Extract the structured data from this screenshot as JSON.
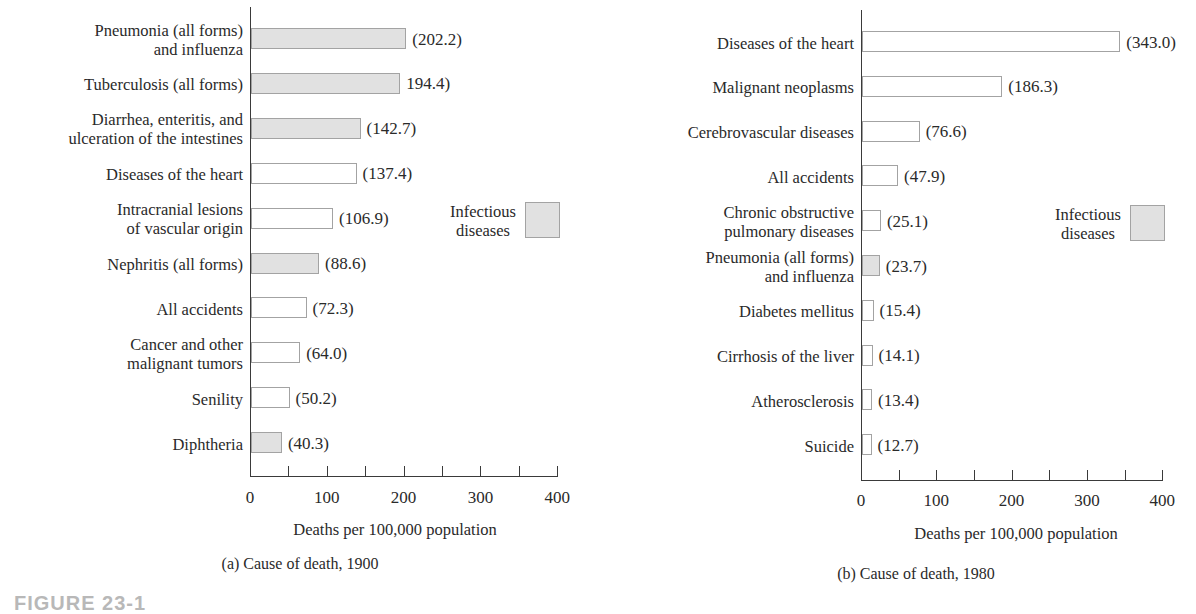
{
  "figure": {
    "label": "FIGURE 23-1"
  },
  "colors": {
    "infectious_fill": "#e1e1e1",
    "other_fill": "#ffffff",
    "bar_border": "#a3a3a3",
    "axis": "#3a3a3a",
    "text": "#2a2a2a"
  },
  "charts": [
    {
      "caption": "(a) Cause of death, 1900",
      "x_title": "Deaths per 100,000 population",
      "x_ticks": [
        "0",
        "100",
        "200",
        "300",
        "400"
      ],
      "legend": {
        "label": "Infectious\ndiseases"
      },
      "bars": [
        {
          "label": "Pneumonia (all forms)\nand influenza",
          "value_label": "(202.2)",
          "infectious": true
        },
        {
          "label": "Tuberculosis (all forms)",
          "value_label": "194.4)",
          "infectious": true
        },
        {
          "label": "Diarrhea, enteritis, and\nulceration of the intestines",
          "value_label": "(142.7)",
          "infectious": true
        },
        {
          "label": "Diseases of the heart",
          "value_label": "(137.4)",
          "infectious": false
        },
        {
          "label": "Intracranial lesions\nof vascular origin",
          "value_label": "(106.9)",
          "infectious": false
        },
        {
          "label": "Nephritis (all forms)",
          "value_label": "(88.6)",
          "infectious": true
        },
        {
          "label": "All accidents",
          "value_label": "(72.3)",
          "infectious": false
        },
        {
          "label": "Cancer and other\nmalignant tumors",
          "value_label": "(64.0)",
          "infectious": false
        },
        {
          "label": "Senility",
          "value_label": "(50.2)",
          "infectious": false
        },
        {
          "label": "Diphtheria",
          "value_label": "(40.3)",
          "infectious": true
        }
      ]
    },
    {
      "caption": "(b) Cause of death, 1980",
      "x_title": "Deaths per 100,000 population",
      "x_ticks": [
        "0",
        "100",
        "200",
        "300",
        "400"
      ],
      "legend": {
        "label": "Infectious\ndiseases"
      },
      "bars": [
        {
          "label": "Diseases of the heart",
          "value_label": "(343.0)",
          "infectious": false
        },
        {
          "label": "Malignant neoplasms",
          "value_label": "(186.3)",
          "infectious": false
        },
        {
          "label": "Cerebrovascular diseases",
          "value_label": "(76.6)",
          "infectious": false
        },
        {
          "label": "All accidents",
          "value_label": "(47.9)",
          "infectious": false
        },
        {
          "label": "Chronic obstructive\npulmonary diseases",
          "value_label": "(25.1)",
          "infectious": false
        },
        {
          "label": "Pneumonia (all forms)\nand influenza",
          "value_label": "(23.7)",
          "infectious": true
        },
        {
          "label": "Diabetes mellitus",
          "value_label": "(15.4)",
          "infectious": false
        },
        {
          "label": "Cirrhosis of the liver",
          "value_label": "(14.1)",
          "infectious": false
        },
        {
          "label": "Atherosclerosis",
          "value_label": "(13.4)",
          "infectious": false
        },
        {
          "label": "Suicide",
          "value_label": "(12.7)",
          "infectious": false
        }
      ]
    }
  ],
  "chart_data": [
    {
      "type": "bar",
      "orientation": "horizontal",
      "title": "(a) Cause of death, 1900",
      "xlabel": "Deaths per 100,000 population",
      "ylabel": "",
      "xlim": [
        0,
        400
      ],
      "x_ticks": [
        0,
        100,
        200,
        300,
        400
      ],
      "x_minor_ticks": [
        50,
        150,
        250,
        350
      ],
      "grid": false,
      "legend": {
        "entries": [
          "Infectious diseases"
        ],
        "position": "right-middle"
      },
      "categories": [
        "Pneumonia (all forms) and influenza",
        "Tuberculosis (all forms)",
        "Diarrhea, enteritis, and ulceration of the intestines",
        "Diseases of the heart",
        "Intracranial lesions of vascular origin",
        "Nephritis (all forms)",
        "All accidents",
        "Cancer and other malignant tumors",
        "Senility",
        "Diphtheria"
      ],
      "values": [
        202.2,
        194.4,
        142.7,
        137.4,
        106.9,
        88.6,
        72.3,
        64.0,
        50.2,
        40.3
      ],
      "infectious": [
        true,
        true,
        true,
        false,
        false,
        true,
        false,
        false,
        false,
        true
      ]
    },
    {
      "type": "bar",
      "orientation": "horizontal",
      "title": "(b) Cause of death, 1980",
      "xlabel": "Deaths per 100,000 population",
      "ylabel": "",
      "xlim": [
        0,
        400
      ],
      "x_ticks": [
        0,
        100,
        200,
        300,
        400
      ],
      "x_minor_ticks": [
        50,
        150,
        250,
        350
      ],
      "grid": false,
      "legend": {
        "entries": [
          "Infectious diseases"
        ],
        "position": "right-middle"
      },
      "categories": [
        "Diseases of the heart",
        "Malignant neoplasms",
        "Cerebrovascular diseases",
        "All accidents",
        "Chronic obstructive pulmonary diseases",
        "Pneumonia (all forms) and influenza",
        "Diabetes mellitus",
        "Cirrhosis of the liver",
        "Atherosclerosis",
        "Suicide"
      ],
      "values": [
        343.0,
        186.3,
        76.6,
        47.9,
        25.1,
        23.7,
        15.4,
        14.1,
        13.4,
        12.7
      ],
      "infectious": [
        false,
        false,
        false,
        false,
        false,
        true,
        false,
        false,
        false,
        false
      ]
    }
  ]
}
